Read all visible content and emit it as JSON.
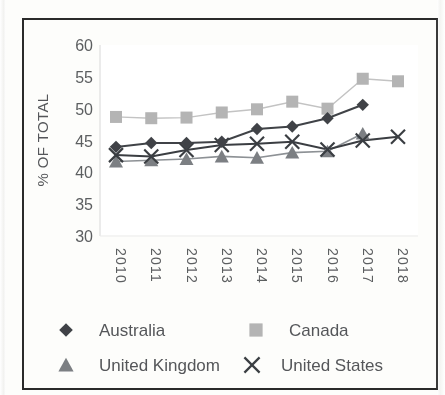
{
  "chart_data": {
    "type": "line",
    "title": "",
    "subtitle": "",
    "xlabel": "",
    "ylabel": "% OF TOTAL",
    "categories": [
      "2010",
      "2011",
      "2012",
      "2013",
      "2014",
      "2015",
      "2016",
      "2017",
      "2018"
    ],
    "x": [
      2010,
      2011,
      2012,
      2013,
      2014,
      2015,
      2016,
      2017,
      2018
    ],
    "ylim": [
      30,
      60
    ],
    "yticks": [
      30,
      35,
      40,
      45,
      50,
      55,
      60
    ],
    "ytick_labels": [
      "30",
      "35",
      "40",
      "45",
      "50",
      "55",
      "60"
    ],
    "grid": false,
    "legend_position": "bottom",
    "xtick_rotation": 90,
    "series": [
      {
        "name": "Australia",
        "marker": "diamond",
        "color": "#3f4347",
        "line_color": "#3f4347",
        "values": [
          44.0,
          44.6,
          44.6,
          44.8,
          46.8,
          47.2,
          48.5,
          50.6,
          null
        ]
      },
      {
        "name": "Canada",
        "marker": "square",
        "color": "#b4b4b4",
        "line_color": "#c3c3c3",
        "values": [
          48.7,
          48.5,
          48.6,
          49.4,
          49.9,
          51.1,
          50.0,
          54.7,
          54.3
        ]
      },
      {
        "name": "United Kingdom",
        "marker": "triangle",
        "color": "#7b7f83",
        "line_color": "#8d9195",
        "values": [
          41.7,
          41.9,
          42.1,
          42.5,
          42.3,
          43.1,
          43.3,
          46.1,
          null
        ]
      },
      {
        "name": "United States",
        "marker": "x",
        "color": "#3a3e42",
        "line_color": "#3a3e42",
        "values": [
          42.7,
          42.5,
          43.5,
          44.3,
          44.5,
          44.8,
          43.6,
          45.0,
          45.6
        ]
      }
    ]
  },
  "axis": {
    "y_title": "% OF TOTAL"
  },
  "legend": {
    "entries": [
      {
        "label": "Australia",
        "marker": "diamond-marker"
      },
      {
        "label": "Canada",
        "marker": "square-marker"
      },
      {
        "label": "United Kingdom",
        "marker": "triangle-marker"
      },
      {
        "label": "United States",
        "marker": "x-marker"
      }
    ]
  }
}
